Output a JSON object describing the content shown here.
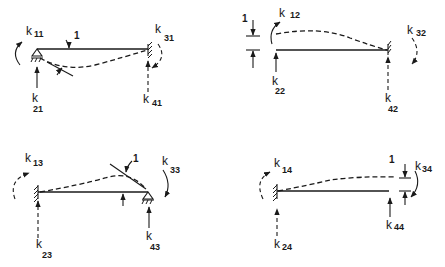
{
  "figure": {
    "panels": [
      {
        "id": "case-1",
        "unit_label": "1",
        "unit_displacement": "rotation at left end",
        "labels": [
          {
            "base": "k",
            "sub": "11"
          },
          {
            "base": "k",
            "sub": "21"
          },
          {
            "base": "k",
            "sub": "31"
          },
          {
            "base": "k",
            "sub": "41"
          }
        ]
      },
      {
        "id": "case-2",
        "unit_label": "1",
        "unit_displacement": "translation at left end",
        "labels": [
          {
            "base": "k",
            "sub": "12"
          },
          {
            "base": "k",
            "sub": "22"
          },
          {
            "base": "k",
            "sub": "32"
          },
          {
            "base": "k",
            "sub": "42"
          }
        ]
      },
      {
        "id": "case-3",
        "unit_label": "1",
        "unit_displacement": "rotation at right end",
        "labels": [
          {
            "base": "k",
            "sub": "13"
          },
          {
            "base": "k",
            "sub": "23"
          },
          {
            "base": "k",
            "sub": "33"
          },
          {
            "base": "k",
            "sub": "43"
          }
        ]
      },
      {
        "id": "case-4",
        "unit_label": "1",
        "unit_displacement": "translation at right end",
        "labels": [
          {
            "base": "k",
            "sub": "14"
          },
          {
            "base": "k",
            "sub": "24"
          },
          {
            "base": "k",
            "sub": "34"
          },
          {
            "base": "k",
            "sub": "44"
          }
        ]
      }
    ]
  }
}
